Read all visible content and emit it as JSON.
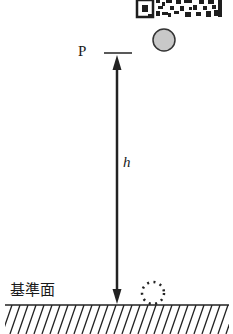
{
  "diagram": {
    "point_label": "P",
    "height_label": "h",
    "reference_plane_label": "基準面",
    "elements": {
      "ball": {
        "description": "gray ball at height h",
        "fill": "#c8c8c8",
        "stroke": "#333333"
      },
      "ball_ground": {
        "description": "dotted circle at reference plane",
        "stroke": "#222222"
      },
      "arrow": {
        "description": "double-headed arrow indicating height h",
        "color": "#222222"
      },
      "ground": {
        "description": "hatched reference plane",
        "color": "#222222"
      },
      "qr_code": {
        "description": "QR code fragment at top"
      }
    }
  }
}
